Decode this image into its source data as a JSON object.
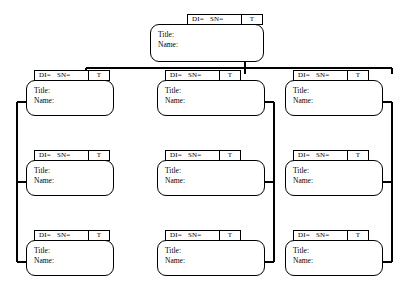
{
  "diagram": {
    "type": "org-chart",
    "line_color": "#000000",
    "background_color": "#ffffff",
    "node_fields": {
      "id_label": "DI=",
      "serial_label": "SN=",
      "type_label": "T",
      "title_label": "Title:",
      "name_label": "Name:"
    },
    "nodes": [
      {
        "id": "root",
        "level": "root",
        "column": "center",
        "id_label": "DI=",
        "serial_label": "SN=",
        "type_label": "T",
        "title_label": "Title:",
        "name_label": "Name:"
      },
      {
        "id": "left-1",
        "level": "child",
        "column": "left",
        "id_label": "DI=",
        "serial_label": "SN=",
        "type_label": "T",
        "title_label": "Title:",
        "name_label": "Name:"
      },
      {
        "id": "left-2",
        "level": "child",
        "column": "left",
        "id_label": "DI=",
        "serial_label": "SN=",
        "type_label": "T",
        "title_label": "Title:",
        "name_label": "Name:"
      },
      {
        "id": "left-3",
        "level": "child",
        "column": "left",
        "id_label": "DI=",
        "serial_label": "SN=",
        "type_label": "T",
        "title_label": "Title:",
        "name_label": "Name:"
      },
      {
        "id": "center-1",
        "level": "child",
        "column": "center",
        "id_label": "DI=",
        "serial_label": "SN=",
        "type_label": "T",
        "title_label": "Title:",
        "name_label": "Name:"
      },
      {
        "id": "center-2",
        "level": "child",
        "column": "center",
        "id_label": "DI=",
        "serial_label": "SN=",
        "type_label": "T",
        "title_label": "Title:",
        "name_label": "Name:"
      },
      {
        "id": "center-3",
        "level": "child",
        "column": "center",
        "id_label": "DI=",
        "serial_label": "SN=",
        "type_label": "T",
        "title_label": "Title:",
        "name_label": "Name:"
      },
      {
        "id": "right-1",
        "level": "child",
        "column": "right",
        "id_label": "DI=",
        "serial_label": "SN=",
        "type_label": "T",
        "title_label": "Title:",
        "name_label": "Name:"
      },
      {
        "id": "right-2",
        "level": "child",
        "column": "right",
        "id_label": "DI=",
        "serial_label": "SN=",
        "type_label": "T",
        "title_label": "Title:",
        "name_label": "Name:"
      },
      {
        "id": "right-3",
        "level": "child",
        "column": "right",
        "id_label": "DI=",
        "serial_label": "SN=",
        "type_label": "T",
        "title_label": "Title:",
        "name_label": "Name:"
      }
    ]
  }
}
